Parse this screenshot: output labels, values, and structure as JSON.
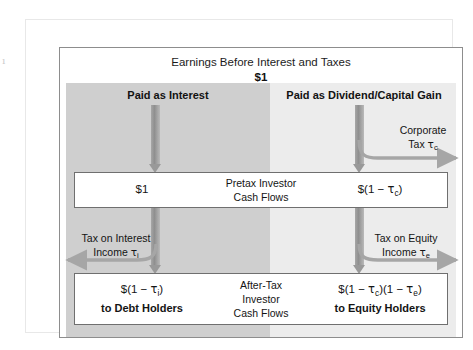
{
  "figure": {
    "header": {
      "title": "Earnings Before Interest and Taxes",
      "amount": "$1"
    },
    "columns": {
      "interest_caption": "Paid as Interest",
      "equity_caption": "Paid as Dividend/Capital Gain"
    },
    "corporate_tax": {
      "line1": "Corporate",
      "line2_prefix": "Tax ",
      "symbol": "τ",
      "subscript": "c"
    },
    "pretax_box": {
      "left_amount": "$1",
      "center_line1": "Pretax Investor",
      "center_line2": "Cash Flows",
      "right_prefix": "$(1 − ",
      "right_symbol": "τ",
      "right_subscript": "c",
      "right_suffix": ")"
    },
    "interest_tax": {
      "line1": "Tax on Interest",
      "line2_prefix": "Income ",
      "symbol": "τ",
      "subscript": "i"
    },
    "equity_tax": {
      "line1": "Tax on Equity",
      "line2_prefix": "Income ",
      "symbol": "τ",
      "subscript": "e"
    },
    "aftertax_box": {
      "left_prefix": "$(1 − ",
      "left_symbol": "τ",
      "left_subscript": "i",
      "left_suffix": ")",
      "left_holders": "to Debt Holders",
      "center_line1": "After-Tax",
      "center_line2": "Investor",
      "center_line3": "Cash Flows",
      "right_prefix": "$(1 − ",
      "right_symbol1": "τ",
      "right_subscript1": "c",
      "right_middle": ")(1 − ",
      "right_symbol2": "τ",
      "right_subscript2": "e",
      "right_suffix": ")",
      "right_holders": "to Equity Holders"
    },
    "page_edge_mark": "¹",
    "colors": {
      "band_interest": "#cfcfcf",
      "band_equity": "#ececec",
      "arrow_gray": "#999999",
      "box_border": "#6f6f6f",
      "panel_border": "#8d8d8d",
      "text": "#141414"
    }
  }
}
